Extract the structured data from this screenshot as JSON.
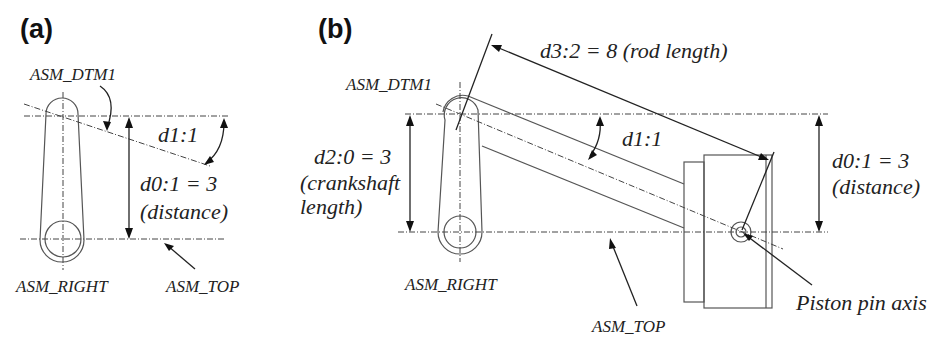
{
  "panels": {
    "a": {
      "title": "(a)",
      "labels": {
        "datum": "ASM_DTM1",
        "angle": "d1:1",
        "distance_line1": "d0:1 = 3",
        "distance_line2": "(distance)",
        "right_plane": "ASM_RIGHT",
        "top_plane": "ASM_TOP"
      }
    },
    "b": {
      "title": "(b)",
      "labels": {
        "datum": "ASM_DTM1",
        "rod_length": "d3:2 = 8 (rod length)",
        "angle": "d1:1",
        "crank_line1": "d2:0 = 3",
        "crank_line2": "(crankshaft",
        "crank_line3": "length)",
        "distance_line1": "d0:1 = 3",
        "distance_line2": "(distance)",
        "right_plane": "ASM_RIGHT",
        "top_plane": "ASM_TOP",
        "pin_axis": "Piston pin axis"
      }
    }
  },
  "colors": {
    "ink": "#222222",
    "outline": "#555555",
    "background": "#ffffff"
  }
}
